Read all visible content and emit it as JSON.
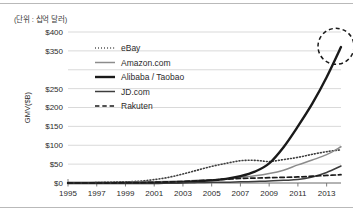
{
  "figure": {
    "unit_note": "(단위 : 십억 달러)",
    "border_color": "#b9b9b9"
  },
  "chart_data": {
    "type": "line",
    "title": "",
    "xlabel": "",
    "ylabel": "GMV($B)",
    "xlim": [
      1995,
      2014
    ],
    "ylim": [
      0,
      400
    ],
    "grid": true,
    "legend_position": "upper-left-inside",
    "x_tick_labels": [
      "1995",
      "1997",
      "1999",
      "2001",
      "2003",
      "2005",
      "2007",
      "2009",
      "2011",
      "2013"
    ],
    "x_ticks": [
      1995,
      1997,
      1999,
      2001,
      2003,
      2005,
      2007,
      2009,
      2011,
      2013
    ],
    "y_tick_labels": [
      "$0",
      "$50",
      "$100",
      "$150",
      "$200",
      "$250",
      "$350",
      "$400"
    ],
    "y_ticks": [
      0,
      50,
      100,
      150,
      200,
      250,
      350,
      400
    ],
    "y_gridlines": [
      0,
      50,
      100,
      150,
      200,
      250,
      300,
      350,
      400
    ],
    "x": [
      1995,
      1996,
      1997,
      1998,
      1999,
      2000,
      2001,
      2002,
      2003,
      2004,
      2005,
      2006,
      2007,
      2008,
      2009,
      2010,
      2011,
      2012,
      2013,
      2014
    ],
    "series": [
      {
        "name": "eBay",
        "style": "dotted",
        "color": "#3d3d3d",
        "width": 1.6,
        "values": [
          0,
          0,
          1,
          2,
          3,
          5,
          9,
          15,
          24,
          34,
          44,
          52,
          59,
          60,
          57,
          62,
          68,
          76,
          83,
          88
        ]
      },
      {
        "name": "Amazon.com",
        "style": "solid",
        "color": "#8c8c8c",
        "width": 1.5,
        "values": [
          0,
          0,
          1,
          1,
          2,
          3,
          3,
          4,
          5,
          7,
          8,
          10,
          15,
          19,
          25,
          34,
          48,
          61,
          75,
          96
        ]
      },
      {
        "name": "Alibaba / Taobao",
        "style": "solid",
        "color": "#1a1a1a",
        "width": 2.4,
        "values": [
          0,
          0,
          0,
          0,
          0,
          0,
          0,
          1,
          2,
          4,
          7,
          11,
          18,
          30,
          52,
          95,
          150,
          210,
          280,
          360
        ]
      },
      {
        "name": "JD.com",
        "style": "solid",
        "color": "#3d3d3d",
        "width": 1.5,
        "values": [
          0,
          0,
          0,
          0,
          0,
          0,
          0,
          0,
          1,
          1,
          2,
          2,
          3,
          4,
          5,
          7,
          9,
          16,
          28,
          45
        ]
      },
      {
        "name": "Rakuten",
        "style": "dashed",
        "color": "#1a1a1a",
        "width": 1.7,
        "values": [
          0,
          0,
          0,
          0,
          1,
          1,
          2,
          3,
          4,
          6,
          8,
          10,
          12,
          13,
          14,
          15,
          16,
          18,
          20,
          22
        ]
      }
    ],
    "annotations": [
      {
        "name": "alibaba-endpoint-highlight",
        "shape": "dashed-circle",
        "x": 2014,
        "y": 362,
        "radius_px": 18
      }
    ]
  }
}
